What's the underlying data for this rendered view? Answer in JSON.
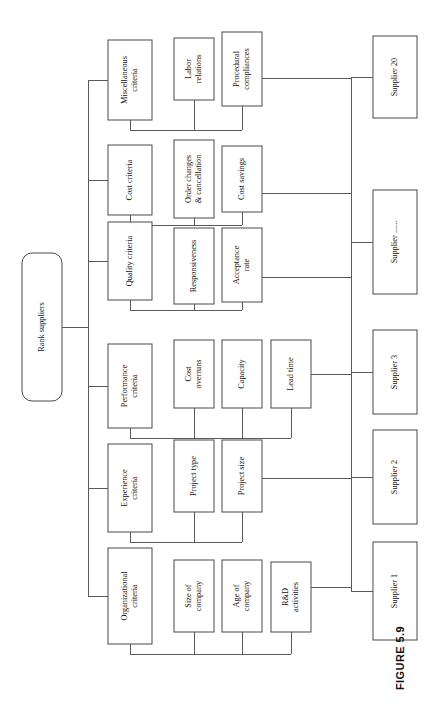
{
  "figure": {
    "caption": "FIGURE 5.9",
    "orientation": "rotated-90-ccw",
    "page_background": "#ffffff",
    "line_color": "#5a5a5a",
    "box_border_color": "#4a4a4a"
  },
  "root": {
    "label": "Rank suppliers",
    "shape": "rounded-rect"
  },
  "criteria": [
    {
      "id": "organizational",
      "label": "Organizational criteria",
      "label_lines": [
        "Organizational",
        "criteria"
      ],
      "subcriteria": [
        {
          "id": "size-of-company",
          "label": "Size of company",
          "label_lines": [
            "Size of",
            "company"
          ]
        },
        {
          "id": "age-of-company",
          "label": "Age of company",
          "label_lines": [
            "Age of",
            "company"
          ]
        },
        {
          "id": "rd-activities",
          "label": "R&D activities",
          "label_lines": [
            "R&D",
            "activities"
          ]
        }
      ]
    },
    {
      "id": "experience",
      "label": "Experience criteria",
      "label_lines": [
        "Experience",
        "criteria"
      ],
      "subcriteria": [
        {
          "id": "project-type",
          "label": "Project type",
          "label_lines": [
            "Project type"
          ]
        },
        {
          "id": "project-size",
          "label": "Project size",
          "label_lines": [
            "Project size"
          ]
        }
      ]
    },
    {
      "id": "performance",
      "label": "Performance criteria",
      "label_lines": [
        "Performance",
        "criteria"
      ],
      "subcriteria": [
        {
          "id": "cost-overruns",
          "label": "Cost overruns",
          "label_lines": [
            "Cost",
            "overruns"
          ]
        },
        {
          "id": "capacity",
          "label": "Capacity",
          "label_lines": [
            "Capacity"
          ]
        },
        {
          "id": "lead-time",
          "label": "Lead time",
          "label_lines": [
            "Lead time"
          ]
        }
      ]
    },
    {
      "id": "quality",
      "label": "Quality criteria",
      "label_lines": [
        "Quality criteria"
      ],
      "subcriteria": [
        {
          "id": "responsiveness",
          "label": "Responsiveness",
          "label_lines": [
            "Responsiveness"
          ]
        },
        {
          "id": "acceptance-rate",
          "label": "Acceptance rate",
          "label_lines": [
            "Acceptance",
            "rate"
          ]
        }
      ]
    },
    {
      "id": "cost",
      "label": "Cost criteria",
      "label_lines": [
        "Cost criteria"
      ],
      "subcriteria": [
        {
          "id": "order-changes-cancellation",
          "label": "Order changes & cancellation",
          "label_lines": [
            "Order changes",
            "& cancellation"
          ]
        },
        {
          "id": "cost-savings",
          "label": "Cost savings",
          "label_lines": [
            "Cost savings"
          ]
        }
      ]
    },
    {
      "id": "miscellaneous",
      "label": "Miscellaneous criteria",
      "label_lines": [
        "Miscellaneous",
        "criteria"
      ],
      "subcriteria": [
        {
          "id": "labor-relations",
          "label": "Labor relations",
          "label_lines": [
            "Labor",
            "relations"
          ]
        },
        {
          "id": "procedural-compliances",
          "label": "Procedural compliances",
          "label_lines": [
            "Procedural",
            "compliances"
          ]
        }
      ]
    }
  ],
  "suppliers": [
    {
      "id": "supplier-1",
      "label": "Supplier 1"
    },
    {
      "id": "supplier-2",
      "label": "Supplier 2"
    },
    {
      "id": "supplier-3",
      "label": "Supplier 3"
    },
    {
      "id": "supplier-ellipsis",
      "label": "Supplier ......"
    },
    {
      "id": "supplier-20",
      "label": "Supplier 20"
    }
  ]
}
